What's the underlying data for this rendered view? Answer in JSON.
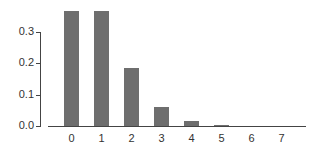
{
  "chart_data": {
    "type": "bar",
    "title": "",
    "xlabel": "",
    "ylabel": "",
    "categories": [
      "0",
      "1",
      "2",
      "3",
      "4",
      "5",
      "6",
      "7"
    ],
    "values": [
      0.368,
      0.368,
      0.184,
      0.061,
      0.015,
      0.003,
      0.0005,
      0.0001
    ],
    "yticks": [
      "0.0",
      "0.1",
      "0.2",
      "0.3"
    ],
    "ylim": [
      0,
      0.37
    ],
    "grid": false,
    "bar_color": "#6e6e6e"
  }
}
